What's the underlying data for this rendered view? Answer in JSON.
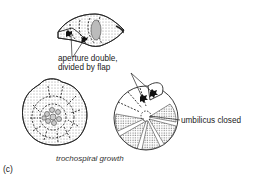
{
  "figure": {
    "panel_label": "(c)",
    "caption": "trochospiral growth",
    "labels": {
      "aperture_line1": "aperture double,",
      "aperture_line2": "divided by flap",
      "umbilicus": "umbilicus closed"
    },
    "elements": [
      {
        "name": "side-view-shell",
        "description": "edge view of test showing double aperture"
      },
      {
        "name": "spiral-side-shell",
        "description": "spiral side view with chambers in a coil"
      },
      {
        "name": "umbilical-side-shell",
        "description": "umbilical side view with closed umbilicus and two aperture openings"
      }
    ],
    "colors": {
      "ink": "#222222",
      "stipple": "#9a9a9a",
      "background": "#ffffff"
    }
  }
}
